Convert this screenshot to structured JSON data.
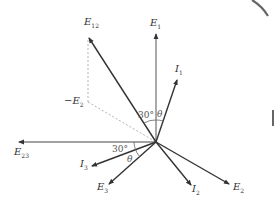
{
  "diagram": {
    "type": "phasor-diagram",
    "origin": [
      156,
      142
    ],
    "colors": {
      "line": "#333333",
      "dashed": "#aaaaaa",
      "text": "#333333",
      "edge_arc": "#666666"
    },
    "vectors": [
      {
        "id": "E1",
        "base": "E",
        "sub": "1",
        "tip": [
          156,
          34
        ],
        "label_pos": [
          150,
          18
        ]
      },
      {
        "id": "E12",
        "base": "E",
        "sub": "12",
        "tip": [
          89,
          38
        ],
        "label_pos": [
          84,
          17
        ]
      },
      {
        "id": "I1",
        "base": "I",
        "sub": "1",
        "tip": [
          177,
          80
        ],
        "label_pos": [
          175,
          64
        ]
      },
      {
        "id": "E23",
        "base": "E",
        "sub": "23",
        "tip": [
          19,
          142
        ],
        "label_pos": [
          14,
          147
        ]
      },
      {
        "id": "I3",
        "base": "I",
        "sub": "3",
        "tip": [
          92,
          166
        ],
        "label_pos": [
          80,
          159
        ]
      },
      {
        "id": "E3",
        "base": "E",
        "sub": "3",
        "tip": [
          109,
          184
        ],
        "label_pos": [
          97,
          182
        ]
      },
      {
        "id": "I2",
        "base": "I",
        "sub": "2",
        "tip": [
          191,
          185
        ],
        "label_pos": [
          192,
          184
        ]
      },
      {
        "id": "E2",
        "base": "E",
        "sub": "2",
        "tip": [
          229,
          184
        ],
        "label_pos": [
          233,
          182
        ]
      }
    ],
    "dashed_lines": [
      {
        "from": [
          88,
          40
        ],
        "to": [
          88,
          102
        ]
      },
      {
        "from": [
          88,
          102
        ],
        "to": [
          156,
          142
        ]
      }
    ],
    "labels": {
      "neg_e2": {
        "prefix": "−",
        "base": "E",
        "sub": "2",
        "pos": [
          64,
          96
        ]
      }
    },
    "angles": [
      {
        "text": "30°",
        "pos": [
          138,
          111
        ]
      },
      {
        "text": "θ",
        "pos": [
          157,
          110
        ]
      },
      {
        "text": "30°",
        "pos": [
          112,
          145
        ]
      },
      {
        "text": "θ",
        "pos": [
          127,
          155
        ]
      }
    ]
  }
}
